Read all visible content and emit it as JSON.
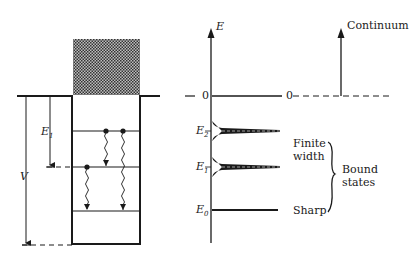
{
  "left_diagram": {
    "label_E1": "E",
    "label_E1_sub": "1",
    "label_V": "V"
  },
  "right_diagram": {
    "axis_label": "E",
    "zero_label_axis": "0",
    "zero_label_continuum": "0",
    "continuum_label": "Continuum",
    "levels": [
      {
        "label": "E",
        "sub": "2",
        "type": "finite-width"
      },
      {
        "label": "E",
        "sub": "1",
        "type": "finite-width"
      },
      {
        "label": "E",
        "sub": "0",
        "type": "sharp"
      }
    ],
    "finite_width_label_line1": "Finite",
    "finite_width_label_line2": "width",
    "sharp_label": "Sharp",
    "bound_states_line1": "Bound",
    "bound_states_line2": "states"
  }
}
